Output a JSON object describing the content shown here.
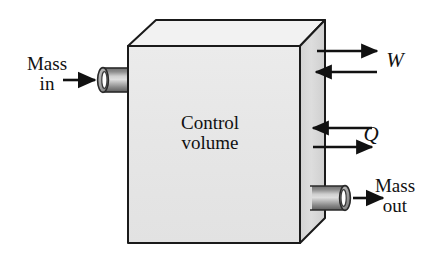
{
  "figure": {
    "kind": "thermodynamics-control-volume-diagram",
    "canvas": {
      "width": 429,
      "height": 268
    },
    "background_color": "#ffffff",
    "box": {
      "name": "control-volume-box",
      "front_face_color": "#e7e7e7",
      "top_face_color": "#f1f1f1",
      "side_face_color": "#dcdcdc",
      "edge_color": "#1a1a1a",
      "label_line1": "Control",
      "label_line2": "volume"
    },
    "labels": {
      "control_volume": "Control\nvolume",
      "mass_in": "Mass\nin",
      "mass_out": "Mass\nout",
      "work": "W",
      "heat": "Q"
    },
    "ports": [
      {
        "name": "inlet-pipe",
        "label": "Mass in",
        "position": "left",
        "flow_direction": "into-control-volume",
        "opening_side": "left",
        "body_color": "#9a9a9a",
        "highlight_color": "#d8d8d8"
      },
      {
        "name": "outlet-pipe",
        "label": "Mass out",
        "position": "right-lower",
        "flow_direction": "out-of-control-volume",
        "opening_side": "right",
        "body_color": "#9a9a9a",
        "highlight_color": "#d8d8d8"
      }
    ],
    "energy_arrows": [
      {
        "name": "work-out-arrow",
        "symbol": "W",
        "direction": "right",
        "meaning": "work out of control volume"
      },
      {
        "name": "work-in-arrow",
        "symbol": "W",
        "direction": "left",
        "meaning": "work into control volume"
      },
      {
        "name": "heat-in-arrow",
        "symbol": "Q",
        "direction": "left",
        "meaning": "heat into control volume"
      },
      {
        "name": "heat-out-arrow",
        "symbol": "Q",
        "direction": "right",
        "meaning": "heat out of control volume"
      }
    ],
    "mass_arrows": [
      {
        "name": "mass-in-arrow",
        "direction": "right",
        "meaning": "mass flowing in"
      },
      {
        "name": "mass-out-arrow",
        "direction": "right",
        "meaning": "mass flowing out"
      }
    ]
  }
}
